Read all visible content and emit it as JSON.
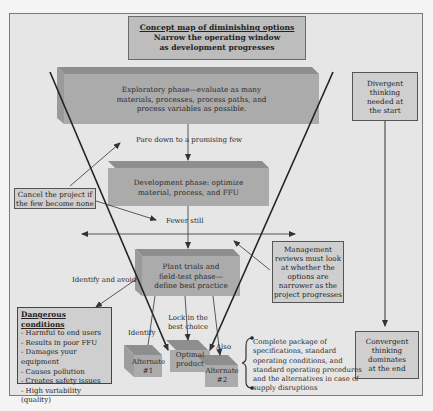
{
  "title": {
    "line1": "Concept map of diminishing options",
    "line2": "Narrow the operating window",
    "line3": "as development progresses"
  },
  "phases": {
    "exploratory": {
      "line1": "Exploratory phase—evaluate as many",
      "line2": "materials, processes, process paths, and",
      "line3": "process variables as possible."
    },
    "development": {
      "line1": "Development phase: optimize",
      "line2": "material, process, and FFU"
    },
    "plant_trials": {
      "line1": "Plant trials and",
      "line2": "field-test phase—",
      "line3": "define best practice"
    }
  },
  "labels": {
    "pare_down": "Pare down to a promising few",
    "fewer_still": "Fewer still",
    "identify_and_avoid": "Identify and avoid",
    "identify": "Identify",
    "lock_in_1": "Lock in the",
    "lock_in_2": "best choice",
    "also": "Also"
  },
  "cancel_box": {
    "line1": "Cancel the project if",
    "line2": "the few become none"
  },
  "management_box": {
    "line1": "Management",
    "line2": "reviews must look",
    "line3": "at whether the",
    "line4": "options are",
    "line5": "narrower as the",
    "line6": "project progresses"
  },
  "divergent_box": {
    "line1": "Divergent",
    "line2": "thinking",
    "line3": "needed at",
    "line4": "the start"
  },
  "convergent_box": {
    "line1": "Convergent",
    "line2": "thinking",
    "line3": "dominates",
    "line4": "at the end"
  },
  "dangerous_conditions": {
    "heading": "Dangerous conditions",
    "items": [
      "- Harmful to end users",
      "- Results in poor FFU",
      "- Damages your equipment",
      "- Causes pollution",
      "- Creates safety issues",
      "- High variability (quality)"
    ]
  },
  "outcomes": {
    "alternate1_line1": "Alternate",
    "alternate1_line2": "#1",
    "optimal_line1": "Optimal",
    "optimal_line2": "product",
    "alternate2_line1": "Alternate",
    "alternate2_line2": "#2"
  },
  "package": {
    "line1": "Complete package of",
    "line2": "specifications, standard",
    "line3": "operating conditions, and",
    "line4": "standard operating procedures",
    "line5": "and the alternatives in case of",
    "line6": "supply disruptions"
  },
  "colors": {
    "frame_bg": "#e6e6e6",
    "slab_front": "#a9a9a9",
    "slab_top": "#8e8e8e",
    "box_fill": "#cfcfcf",
    "line": "#333333"
  }
}
